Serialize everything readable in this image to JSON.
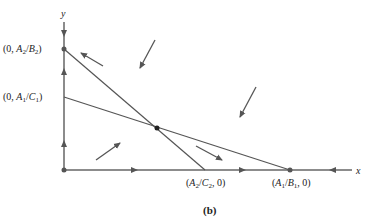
{
  "figure": {
    "caption": "(b)",
    "axes": {
      "x_label": "x",
      "y_label": "y"
    },
    "points": {
      "y_intercept_upper": "(0, A2/B2)",
      "y_intercept_lower": "(0, A1/C1)",
      "x_intercept_left": "(A2/C2, 0)",
      "x_intercept_right": "(A1/B1, 0)"
    },
    "line_color": "#555555"
  }
}
